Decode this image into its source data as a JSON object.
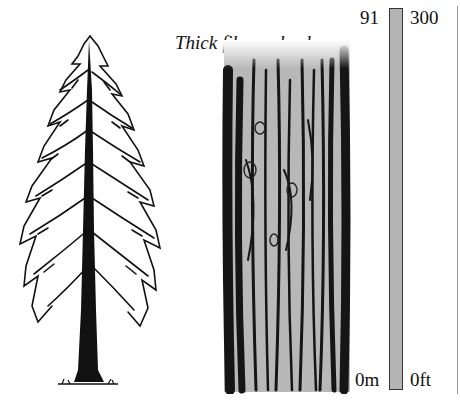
{
  "title": "Thick fibrous bark",
  "illustrations": {
    "tree": {
      "name": "conifer-tree (redwood)"
    },
    "bark": {
      "name": "bark-texture",
      "fill": "#b8b8b8",
      "stroke": "#1a1a1a"
    }
  },
  "scale": {
    "metric": {
      "top": "91",
      "bottom": "0m"
    },
    "imperial": {
      "top": "300",
      "bottom": "0ft"
    },
    "bar_color": "#b4b4b4"
  }
}
